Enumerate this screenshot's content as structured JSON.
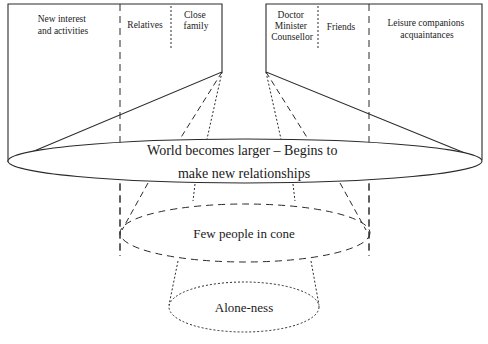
{
  "diagram": {
    "title": "",
    "left_panel": {
      "sections": [
        {
          "lines": [
            "New interest",
            "and activities"
          ]
        },
        {
          "lines": [
            "Relatives"
          ]
        },
        {
          "lines": [
            "Close",
            "family"
          ]
        }
      ]
    },
    "right_panel": {
      "sections": [
        {
          "lines": [
            "Doctor",
            "Minister",
            "Counsellor"
          ]
        },
        {
          "lines": [
            "Friends"
          ]
        },
        {
          "lines": [
            "Leisure companions",
            "acquaintances"
          ]
        }
      ]
    },
    "levels": [
      {
        "name": "outer",
        "lines": [
          "World becomes larger – Begins to",
          "make new relationships"
        ],
        "style": "solid"
      },
      {
        "name": "middle",
        "lines": [
          "Few people in cone"
        ],
        "style": "dashed"
      },
      {
        "name": "inner",
        "lines": [
          "Alone-ness"
        ],
        "style": "dotted"
      }
    ],
    "colors": {
      "stroke": "#2a2a2a",
      "background": "#ffffff"
    }
  }
}
